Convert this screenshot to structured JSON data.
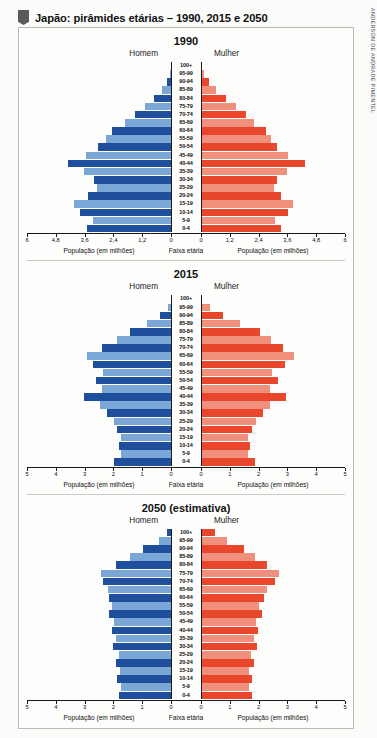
{
  "header": {
    "title": "Japão: pirâmides etárias – 1990, 2015 e 2050",
    "credit": "ANDERSON DE ANDRADE PIMENTEL"
  },
  "labels": {
    "male": "Homem",
    "female": "Mulher",
    "axis_caption_population": "População (em milhões)",
    "axis_caption_age": "Faixa etária"
  },
  "colors": {
    "male_dark": "#1f4e9c",
    "male_light": "#7ba7d7",
    "female_dark": "#e8472b",
    "female_light": "#f0907c",
    "axis": "#1a1a1a",
    "frame": "#b9b9b5"
  },
  "age_groups": [
    "100+",
    "95-99",
    "90-94",
    "85-89",
    "80-84",
    "75-79",
    "70-74",
    "65-69",
    "60-64",
    "55-59",
    "50-54",
    "45-49",
    "40-44",
    "35-39",
    "30-34",
    "25-29",
    "20-24",
    "15-19",
    "10-14",
    "5-9",
    "0-4"
  ],
  "chart_data": [
    {
      "type": "bar",
      "title": "1990",
      "subtype": "population-pyramid",
      "xlabel": "População (em milhões)",
      "ylabel": "Faixa etária",
      "xlim": [
        0,
        6
      ],
      "ticks": [
        "6",
        "4,8",
        "3,6",
        "2,4",
        "1,2",
        "0"
      ],
      "tick_values": [
        6,
        4.8,
        3.6,
        2.4,
        1.2,
        0
      ],
      "grid": false,
      "categories": [
        "100+",
        "95-99",
        "90-94",
        "85-89",
        "80-84",
        "75-79",
        "70-74",
        "65-69",
        "60-64",
        "55-59",
        "50-54",
        "45-49",
        "40-44",
        "35-39",
        "30-34",
        "25-29",
        "20-24",
        "15-19",
        "10-14",
        "5-9",
        "0-4"
      ],
      "series": [
        {
          "name": "Homem",
          "values": [
            0.01,
            0.06,
            0.16,
            0.38,
            0.72,
            1.1,
            1.52,
            1.9,
            2.45,
            2.72,
            3.03,
            3.55,
            4.3,
            3.62,
            3.22,
            3.1,
            3.45,
            4.03,
            3.8,
            3.25,
            3.48
          ]
        },
        {
          "name": "Mulher",
          "values": [
            0.03,
            0.14,
            0.32,
            0.62,
            1.06,
            1.45,
            1.86,
            2.2,
            2.7,
            2.92,
            3.18,
            3.62,
            4.32,
            3.58,
            3.16,
            3.04,
            3.35,
            3.85,
            3.62,
            3.1,
            3.32
          ]
        }
      ]
    },
    {
      "type": "bar",
      "title": "2015",
      "subtype": "population-pyramid",
      "xlabel": "População (em milhões)",
      "ylabel": "Faixa etária",
      "xlim": [
        0,
        5
      ],
      "ticks": [
        "5",
        "4",
        "3",
        "2",
        "1",
        "0"
      ],
      "tick_values": [
        5,
        4,
        3,
        2,
        1,
        0
      ],
      "grid": false,
      "categories": [
        "100+",
        "95-99",
        "90-94",
        "85-89",
        "80-84",
        "75-79",
        "70-74",
        "65-69",
        "60-64",
        "55-59",
        "50-54",
        "45-49",
        "40-44",
        "35-39",
        "30-34",
        "25-29",
        "20-24",
        "15-19",
        "10-14",
        "5-9",
        "0-4"
      ],
      "series": [
        {
          "name": "Homem",
          "values": [
            0.01,
            0.12,
            0.39,
            0.85,
            1.42,
            1.86,
            2.38,
            2.92,
            2.7,
            2.35,
            2.62,
            2.4,
            3.02,
            2.48,
            2.23,
            1.98,
            1.88,
            1.72,
            1.8,
            1.72,
            1.98
          ]
        },
        {
          "name": "Mulher",
          "values": [
            0.05,
            0.3,
            0.75,
            1.35,
            2.05,
            2.42,
            2.85,
            3.22,
            2.9,
            2.46,
            2.68,
            2.4,
            2.96,
            2.4,
            2.14,
            1.9,
            1.78,
            1.63,
            1.7,
            1.64,
            1.88
          ]
        }
      ]
    },
    {
      "type": "bar",
      "title": "2050 (estimativa)",
      "subtype": "population-pyramid",
      "xlabel": "População (em milhões)",
      "ylabel": "Faixa etária",
      "xlim": [
        0,
        5
      ],
      "ticks": [
        "5",
        "4",
        "3",
        "2",
        "1",
        "0"
      ],
      "tick_values": [
        5,
        4,
        3,
        2,
        1,
        0
      ],
      "grid": false,
      "categories": [
        "100+",
        "95-99",
        "90-94",
        "85-89",
        "80-84",
        "75-79",
        "70-74",
        "65-69",
        "60-64",
        "55-59",
        "50-54",
        "45-49",
        "40-44",
        "35-39",
        "30-34",
        "25-29",
        "20-24",
        "15-19",
        "10-14",
        "5-9",
        "0-4"
      ],
      "series": [
        {
          "name": "Homem",
          "values": [
            0.14,
            0.42,
            0.98,
            1.44,
            1.92,
            2.44,
            2.36,
            2.18,
            2.16,
            2.04,
            2.16,
            1.98,
            2.06,
            1.92,
            2.02,
            1.8,
            1.92,
            1.76,
            1.86,
            1.74,
            1.82
          ]
        },
        {
          "name": "Mulher",
          "values": [
            0.48,
            0.92,
            1.48,
            1.86,
            2.28,
            2.7,
            2.56,
            2.3,
            2.2,
            2.02,
            2.12,
            1.92,
            1.98,
            1.84,
            1.94,
            1.72,
            1.84,
            1.68,
            1.78,
            1.68,
            1.76
          ]
        }
      ]
    }
  ]
}
